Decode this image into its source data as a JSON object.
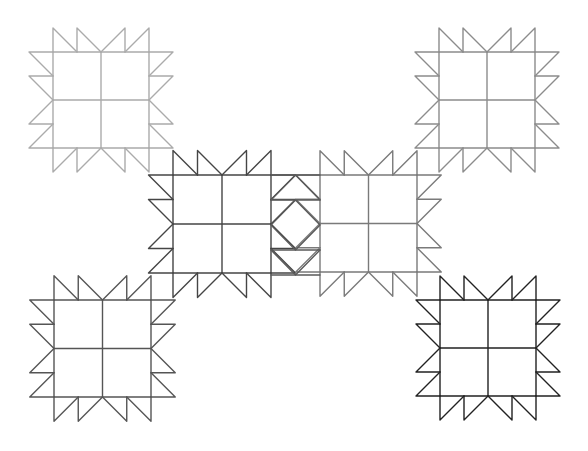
{
  "diagram": {
    "width": 588,
    "height": 451,
    "background": "#ffffff",
    "unit": 24.5,
    "blocks": [
      {
        "id": "top-left",
        "x": 53,
        "y": 52,
        "size": 96,
        "color": "#ababab"
      },
      {
        "id": "top-right",
        "x": 439,
        "y": 52,
        "size": 96,
        "color": "#8c8c8c"
      },
      {
        "id": "center-left",
        "x": 173,
        "y": 175,
        "size": 98,
        "color": "#454545"
      },
      {
        "id": "center-right",
        "x": 320,
        "y": 175,
        "size": 97,
        "color": "#7a7a7a"
      },
      {
        "id": "bottom-left",
        "x": 54,
        "y": 300,
        "size": 97,
        "color": "#555555"
      },
      {
        "id": "bottom-right",
        "x": 440,
        "y": 300,
        "size": 96,
        "color": "#222222"
      }
    ],
    "sashing": {
      "x1": 271,
      "x2": 320,
      "y1": 175,
      "y2": 275,
      "color": "#5a5a5a"
    }
  }
}
